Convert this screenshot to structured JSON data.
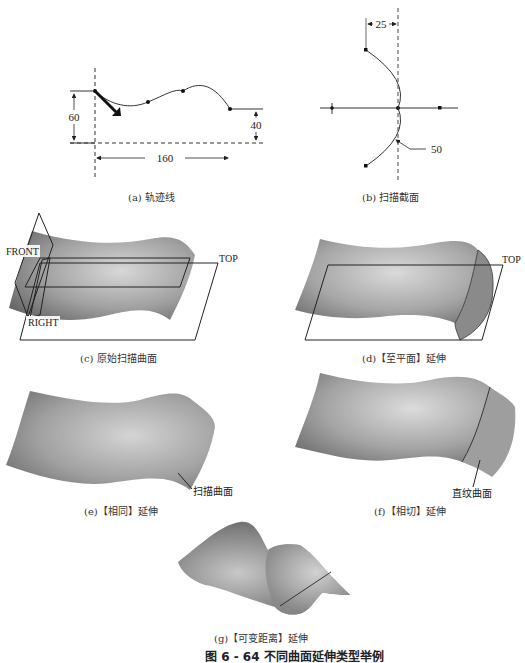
{
  "figure": {
    "title": "图 6 - 64   不同曲面延伸类型举例"
  },
  "panels": {
    "a": {
      "caption": "(a) 轨迹线",
      "dims": {
        "height_left": "60",
        "height_right": "40",
        "width": "160"
      }
    },
    "b": {
      "caption": "(b) 扫描截面",
      "dims": {
        "offset": "25",
        "radius": "50"
      }
    },
    "c": {
      "caption": "(c) 原始扫描曲面",
      "labels": {
        "front": "FRONT",
        "top": "TOP",
        "right": "RIGHT"
      }
    },
    "d": {
      "caption": "(d)【至平面】延伸",
      "labels": {
        "top": "TOP"
      }
    },
    "e": {
      "caption": "(e)【相同】延伸",
      "labels": {
        "callout": "扫描曲面"
      }
    },
    "f": {
      "caption": "(f)【相切】延伸",
      "labels": {
        "callout": "直纹曲面"
      }
    },
    "g": {
      "caption": "(g)【可变距离】延伸"
    }
  },
  "colors": {
    "surface_light": "#d6d6d6",
    "surface_mid": "#a8a8a8",
    "surface_dark": "#6e6e6e",
    "line": "#222222"
  }
}
